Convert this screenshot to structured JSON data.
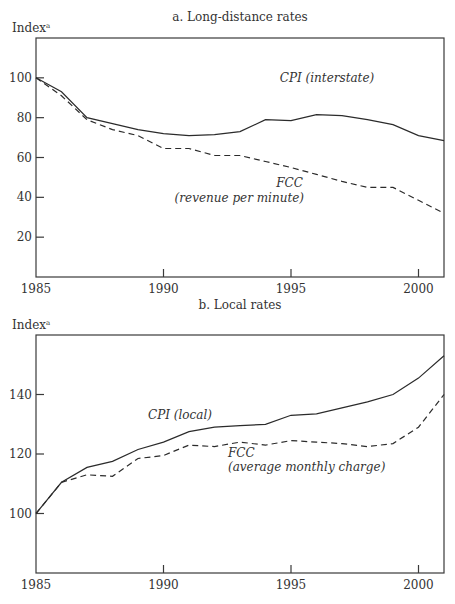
{
  "chart_data": [
    {
      "type": "line",
      "title": "a. Long-distance rates",
      "ylabel": "Index",
      "ylabel_superscript": "a",
      "xlabel": "",
      "x": [
        1985,
        1986,
        1987,
        1988,
        1989,
        1990,
        1991,
        1992,
        1993,
        1994,
        1995,
        1996,
        1997,
        1998,
        1999,
        2000,
        2001
      ],
      "xlim": [
        1985,
        2001
      ],
      "ylim": [
        0,
        120
      ],
      "xticks": [
        1985,
        1990,
        1995,
        2000
      ],
      "xtick_labels": [
        "1985",
        "1990",
        "1995",
        "2000"
      ],
      "yticks": [
        20,
        40,
        60,
        80,
        100
      ],
      "ytick_labels": [
        "20",
        "40",
        "60",
        "80",
        "100"
      ],
      "grid": false,
      "legend": "none (inline annotations)",
      "series": [
        {
          "name": "CPI (interstate)",
          "style": "solid",
          "values": [
            100,
            93,
            80,
            77,
            74,
            72,
            71,
            71.5,
            73,
            79,
            78.5,
            81.5,
            81,
            79,
            76.5,
            71,
            68.5
          ]
        },
        {
          "name": "FCC (revenue per minute)",
          "style": "dashed",
          "values": [
            100,
            91,
            79,
            74,
            71,
            64.5,
            64.5,
            61,
            61,
            58,
            55,
            51.5,
            48,
            45,
            45,
            38.5,
            32
          ]
        }
      ],
      "annotations": [
        {
          "text": "CPI (interstate)",
          "series": "CPI (interstate)"
        },
        {
          "text": "FCC",
          "series": "FCC (revenue per minute)"
        },
        {
          "text": "(revenue per minute)",
          "series": "FCC (revenue per minute)"
        }
      ]
    },
    {
      "type": "line",
      "title": "b. Local rates",
      "ylabel": "Index",
      "ylabel_superscript": "a",
      "xlabel": "",
      "x": [
        1985,
        1986,
        1987,
        1988,
        1989,
        1990,
        1991,
        1992,
        1993,
        1994,
        1995,
        1996,
        1997,
        1998,
        1999,
        2000,
        2001
      ],
      "xlim": [
        1985,
        2001
      ],
      "ylim": [
        80,
        160
      ],
      "xticks": [
        1985,
        1990,
        1995,
        2000
      ],
      "xtick_labels": [
        "1985",
        "1990",
        "1995",
        "2000"
      ],
      "yticks": [
        100,
        120,
        140
      ],
      "ytick_labels": [
        "100",
        "120",
        "140"
      ],
      "grid": false,
      "legend": "none (inline annotations)",
      "series": [
        {
          "name": "CPI (local)",
          "style": "solid",
          "values": [
            100,
            110.5,
            115.5,
            117.5,
            121.5,
            124,
            127.5,
            129,
            129.5,
            130,
            133,
            133.5,
            135.5,
            137.5,
            140,
            145.5,
            153
          ]
        },
        {
          "name": "FCC (average monthly charge)",
          "style": "dashed",
          "values": [
            100,
            110.5,
            113,
            112.5,
            118.5,
            119.5,
            123,
            122.5,
            124,
            123,
            124.5,
            124,
            123.5,
            122.5,
            123.5,
            129,
            140
          ]
        }
      ],
      "annotations": [
        {
          "text": "CPI (local)",
          "series": "CPI (local)"
        },
        {
          "text": "FCC",
          "series": "FCC (average monthly charge)"
        },
        {
          "text": "(average monthly charge)",
          "series": "FCC (average monthly charge)"
        }
      ]
    }
  ]
}
